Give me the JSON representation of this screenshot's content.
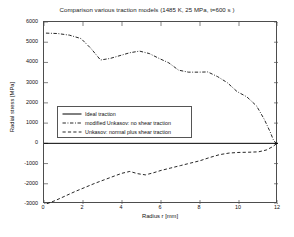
{
  "chart_data": {
    "type": "line",
    "title": "Comparison various traction models (1485 K, 25 MPa, t=600 s )",
    "xlabel": "Radius r [mm]",
    "ylabel": "Radial stress [MPa]",
    "xlim": [
      0,
      12
    ],
    "ylim": [
      -3000,
      6000
    ],
    "xticks": [
      0,
      2,
      4,
      6,
      8,
      10,
      12
    ],
    "yticks": [
      -3000,
      -2000,
      -1000,
      0,
      1000,
      2000,
      3000,
      4000,
      5000,
      6000
    ],
    "xtick_labels": [
      "0",
      "2",
      "4",
      "6",
      "8",
      "10",
      "12"
    ],
    "ytick_labels": [
      "-3000",
      "-2000",
      "-1000",
      "0",
      "1000",
      "2000",
      "3000",
      "4000",
      "5000",
      "6000"
    ],
    "grid": false,
    "legend_position": "center-left",
    "series": [
      {
        "name": "Ideal traction",
        "style": "solid",
        "color": "#000000",
        "x": [
          0,
          12
        ],
        "y": [
          0,
          0
        ]
      },
      {
        "name": "modified Unkasov: no shear traction",
        "style": "dash-dot",
        "color": "#000000",
        "x": [
          0.1,
          0.7,
          1.3,
          1.9,
          2.4,
          2.9,
          3.4,
          3.9,
          4.4,
          4.9,
          5.4,
          5.9,
          6.4,
          6.9,
          7.4,
          7.9,
          8.4,
          8.9,
          9.4,
          9.9,
          10.4,
          10.9,
          11.3,
          11.6,
          11.75,
          11.85,
          11.92
        ],
        "y": [
          5450,
          5430,
          5350,
          5180,
          4700,
          4120,
          4200,
          4340,
          4480,
          4560,
          4440,
          4200,
          3980,
          3620,
          3520,
          3520,
          3530,
          3300,
          3000,
          2560,
          2300,
          1850,
          1180,
          560,
          200,
          60,
          0
        ]
      },
      {
        "name": "Unkasov: normal plus shear traction",
        "style": "dashed",
        "color": "#000000",
        "x": [
          0.15,
          0.6,
          1.1,
          1.6,
          2.1,
          2.6,
          3.1,
          3.6,
          4.0,
          4.4,
          4.8,
          5.2,
          5.6,
          6.0,
          6.5,
          7.0,
          7.5,
          8.0,
          8.5,
          9.0,
          9.5,
          10.0,
          10.5,
          11.0,
          11.4,
          11.7,
          11.9
        ],
        "y": [
          -2990,
          -2820,
          -2600,
          -2380,
          -2180,
          -1980,
          -1800,
          -1620,
          -1480,
          -1390,
          -1500,
          -1560,
          -1460,
          -1340,
          -1220,
          -1100,
          -980,
          -860,
          -700,
          -560,
          -480,
          -450,
          -440,
          -420,
          -330,
          -180,
          -40
        ]
      }
    ]
  },
  "legend": {
    "items": [
      {
        "label": "Ideal traction",
        "style": "solid"
      },
      {
        "label": "modified Unkasov: no shear traction",
        "style": "dash-dot"
      },
      {
        "label": "Unkasov: normal plus shear traction",
        "style": "dashed"
      }
    ]
  },
  "colors": {
    "line": "#000000",
    "frame": "#4d4d4d",
    "background": "#ffffff",
    "text": "#111111"
  }
}
